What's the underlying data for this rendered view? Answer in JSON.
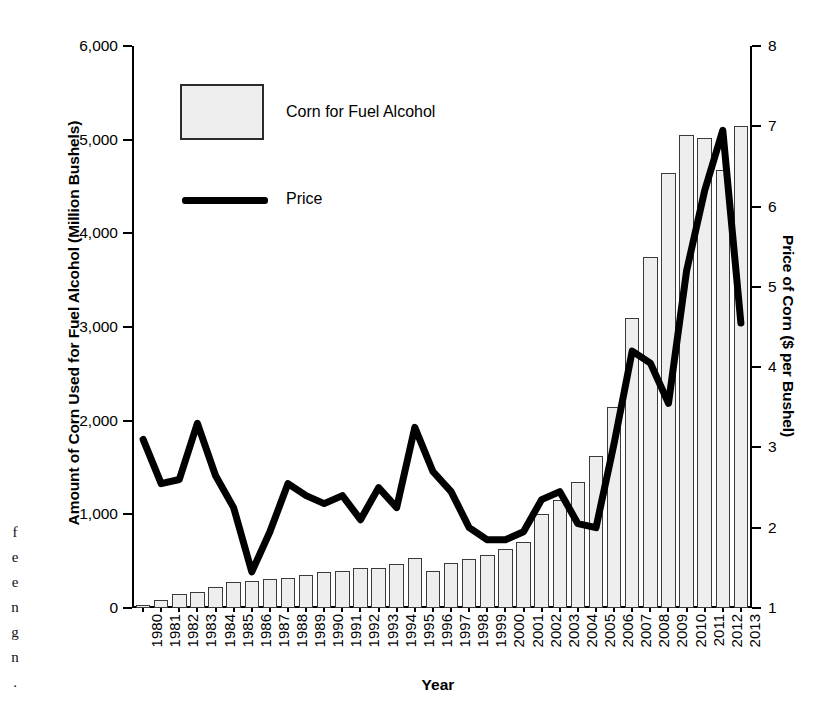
{
  "page_margin_text": [
    "f",
    "e",
    "e",
    "n",
    "g",
    "n",
    "."
  ],
  "axes": {
    "left_title": "Amount of Corn Used for Fuel Alcohol (Million Bushels)",
    "right_title": "Price of Corn ($ per Bushel)",
    "x_title": "Year"
  },
  "legend": {
    "bar_label": "Corn for Fuel Alcohol",
    "line_label": "Price",
    "bar_fill": "#eeeeee",
    "bar_stroke": "#2b2b2b",
    "line_color": "#000000"
  },
  "chart_data": {
    "type": "bar",
    "title": "",
    "xlabel": "Year",
    "ylabel": "Amount of Corn Used for Fuel Alcohol (Million Bushels)",
    "y2label": "Price of Corn ($ per Bushel)",
    "grid": false,
    "legend_position": "top-left",
    "ylim": [
      0,
      6000
    ],
    "y2lim": [
      1,
      8
    ],
    "yticks": [
      "0",
      "1,000",
      "2,000",
      "3,000",
      "4,000",
      "5,000",
      "6,000"
    ],
    "ytick_values": [
      0,
      1000,
      2000,
      3000,
      4000,
      5000,
      6000
    ],
    "y2ticks": [
      "1",
      "2",
      "3",
      "4",
      "5",
      "6",
      "7",
      "8"
    ],
    "y2tick_values": [
      1,
      2,
      3,
      4,
      5,
      6,
      7,
      8
    ],
    "categories": [
      "1980",
      "1981",
      "1982",
      "1983",
      "1984",
      "1985",
      "1986",
      "1987",
      "1988",
      "1989",
      "1990",
      "1991",
      "1992",
      "1993",
      "1994",
      "1995",
      "1996",
      "1997",
      "1998",
      "1999",
      "2000",
      "2001",
      "2002",
      "2003",
      "2004",
      "2005",
      "2006",
      "2007",
      "2008",
      "2009",
      "2010",
      "2011",
      "2012",
      "2013"
    ],
    "series": [
      {
        "name": "Corn for Fuel Alcohol",
        "type": "bar",
        "axis": "left",
        "unit": "million bushels",
        "values": [
          35,
          90,
          150,
          175,
          220,
          275,
          285,
          310,
          325,
          350,
          380,
          400,
          425,
          430,
          470,
          530,
          400,
          480,
          525,
          565,
          630,
          710,
          1000,
          1150,
          1350,
          1620,
          2150,
          3100,
          3750,
          4640,
          5050,
          5020,
          4680,
          5150
        ]
      },
      {
        "name": "Price",
        "type": "line",
        "axis": "right",
        "unit": "$ per bushel",
        "values": [
          3.1,
          2.55,
          2.6,
          3.3,
          2.65,
          2.25,
          1.45,
          1.95,
          2.55,
          2.4,
          2.3,
          2.4,
          2.1,
          2.5,
          2.25,
          3.25,
          2.7,
          2.45,
          2.0,
          1.85,
          1.85,
          1.95,
          2.35,
          2.45,
          2.05,
          2.0,
          3.05,
          4.2,
          4.05,
          3.55,
          5.2,
          6.2,
          6.95,
          4.55
        ]
      }
    ]
  }
}
